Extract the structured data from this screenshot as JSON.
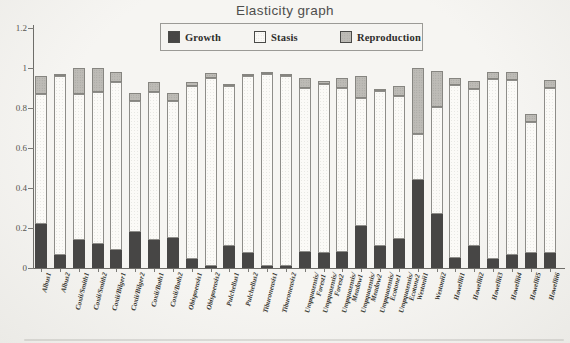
{
  "title": "Elasticity graph",
  "chart_data": {
    "type": "bar",
    "stacked": true,
    "title": "Elasticity graph",
    "xlabel": "",
    "ylabel": "",
    "ylim": [
      0,
      1.2
    ],
    "yticks": [
      0,
      0.2,
      0.4,
      0.6,
      0.8,
      1,
      1.2
    ],
    "ytick_labels": [
      "0",
      "0.2",
      "0.4",
      "0.6",
      "0.8",
      "1",
      "1.2"
    ],
    "grid": false,
    "legend_position": "top",
    "categories": [
      "Albus1",
      "Albus2",
      "Coxii/Smith1",
      "Coxii/Smith2",
      "Coxii/Bilger1",
      "Coxii/Bilger2",
      "Coxii/Both1",
      "Coxii/Both2",
      "Obispoensis1",
      "Obispoensis2",
      "Pulchellus1",
      "Pulchellus2",
      "Tiburonensis1",
      "Tiburonensis2",
      "Umpquaensis/Forest1",
      "Umpquaensis/Forest2",
      "Umpquaensis/Meadow1",
      "Umpquaensis/Meadow2",
      "Umpquaensis/Ecotone1",
      "Umpquaensis/Ecotone2",
      "Westonii1",
      "Westonii2",
      "Howellii1",
      "Howellii2",
      "Howellii3",
      "Howellii4",
      "Howellii5",
      "Howellii6"
    ],
    "series": [
      {
        "name": "Growth",
        "color": "#474645",
        "values": [
          0.22,
          0.065,
          0.14,
          0.12,
          0.09,
          0.18,
          0.14,
          0.15,
          0.045,
          0.01,
          0.11,
          0.075,
          0.01,
          0.01,
          0.08,
          0.075,
          0.08,
          0.21,
          0.11,
          0.145,
          0.44,
          0.27,
          0.05,
          0.11,
          0.045,
          0.065,
          0.075,
          0.075
        ]
      },
      {
        "name": "Stasis",
        "color": "#fbfaf7",
        "values": [
          0.65,
          0.895,
          0.73,
          0.76,
          0.84,
          0.655,
          0.74,
          0.685,
          0.865,
          0.94,
          0.8,
          0.885,
          0.96,
          0.95,
          0.82,
          0.845,
          0.82,
          0.64,
          0.775,
          0.715,
          0.23,
          0.535,
          0.865,
          0.785,
          0.9,
          0.875,
          0.655,
          0.825
        ]
      },
      {
        "name": "Reproduction",
        "color": "#bdbbb6",
        "values": [
          0.09,
          0.01,
          0.13,
          0.12,
          0.05,
          0.04,
          0.05,
          0.04,
          0.02,
          0.025,
          0.01,
          0.01,
          0.01,
          0.01,
          0.05,
          0.015,
          0.05,
          0.11,
          0.01,
          0.05,
          0.33,
          0.18,
          0.035,
          0.04,
          0.035,
          0.04,
          0.04,
          0.04
        ]
      }
    ]
  }
}
